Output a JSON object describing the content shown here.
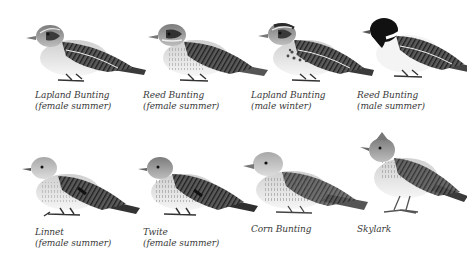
{
  "plate": {
    "rows": [
      {
        "birds": [
          {
            "name": "Lapland Bunting",
            "detail": "(female summer)",
            "id": "lapland-bunting-female-summer"
          },
          {
            "name": "Reed Bunting",
            "detail": "(female summer)",
            "id": "reed-bunting-female-summer"
          },
          {
            "name": "Lapland Bunting",
            "detail": "(male winter)",
            "id": "lapland-bunting-male-winter"
          },
          {
            "name": "Reed Bunting",
            "detail": "(male summer)",
            "id": "reed-bunting-male-summer"
          }
        ]
      },
      {
        "birds": [
          {
            "name": "Linnet",
            "detail": "(female summer)",
            "id": "linnet-female-summer"
          },
          {
            "name": "Twite",
            "detail": "(female summer)",
            "id": "twite-female-summer"
          },
          {
            "name": "Corn Bunting",
            "detail": "",
            "id": "corn-bunting"
          },
          {
            "name": "Skylark",
            "detail": "",
            "id": "skylark"
          }
        ]
      }
    ]
  },
  "colors": {
    "background": "#ffffff",
    "caption_text": "#3a3a3a",
    "plumage_dark": "#2e2e2e",
    "plumage_mid": "#7a7a7a",
    "plumage_light": "#d8d8d8"
  }
}
